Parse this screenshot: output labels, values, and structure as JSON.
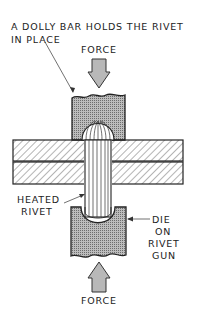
{
  "diagram": {
    "title_line1": "A DOLLY BAR HOLDS THE RIVET",
    "title_line2": "IN PLACE",
    "force_top": "FORCE",
    "force_bottom": "FORCE",
    "heated_rivet_line1": "HEATED",
    "heated_rivet_line2": "RIVET",
    "die_line1": "DIE",
    "die_line2": "ON",
    "die_line3": "RIVET",
    "die_line4": "GUN"
  },
  "colors": {
    "stroke": "#222222",
    "block_fill": "#9a9a9a",
    "plate_fill": "#ffffff",
    "arrow_fill": "#b0b0b0"
  }
}
